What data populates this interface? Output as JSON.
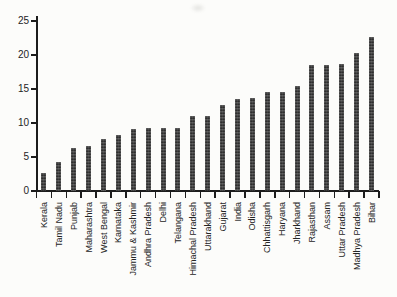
{
  "chart_data": {
    "type": "bar",
    "title": "",
    "xlabel": "",
    "ylabel": "",
    "categories": [
      "Kerala",
      "Tamil Nadu",
      "Punjab",
      "Maharashtra",
      "West Bengal",
      "Karnataka",
      "Jammu & Kashmir",
      "Andhra Pradesh",
      "Delhi",
      "Telangana",
      "Himachal Pradesh",
      "Uttarakhand",
      "Gujarat",
      "India",
      "Odisha",
      "Chhattisgarh",
      "Haryana",
      "Jharkhand",
      "Rajasthan",
      "Assam",
      "Uttar Pradesh",
      "Madhya Pradesh",
      "Bihar"
    ],
    "values": [
      2.7,
      4.3,
      6.3,
      6.6,
      7.6,
      8.3,
      9.1,
      9.3,
      9.3,
      9.3,
      11.1,
      11.0,
      12.7,
      13.5,
      13.7,
      14.5,
      14.6,
      15.5,
      18.5,
      18.6,
      18.7,
      20.3,
      22.7
    ],
    "ylim": [
      0,
      25
    ],
    "yticks": [
      "0",
      "5",
      "10",
      "15",
      "20",
      "25"
    ],
    "grid": false,
    "legend": "none",
    "bar_color": "#3d3d3d",
    "axis_color": "#1c1c1c",
    "text_color": "#242424",
    "background_color": "#fcfcfa"
  }
}
